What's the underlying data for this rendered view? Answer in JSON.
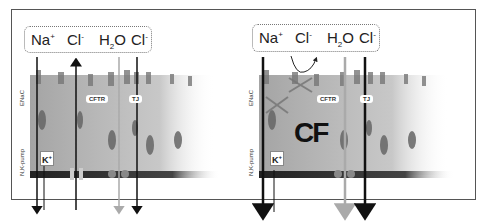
{
  "panels": [
    {
      "id": "normal",
      "lumen_ions": [
        {
          "base": "Na",
          "sup": "+",
          "sub": ""
        },
        {
          "base": "Cl",
          "sup": "-",
          "sub": ""
        },
        {
          "base": "H",
          "sub": "2",
          "sup": "",
          "tail": "O"
        },
        {
          "base": "Cl",
          "sup": "-",
          "sub": ""
        }
      ],
      "labels": {
        "enac": "ENaC",
        "cftr": "CFTR",
        "tj": "TJ",
        "pump": "N,K-pump",
        "k": "K",
        "k_sup": "+"
      }
    },
    {
      "id": "cystic-fibrosis",
      "lumen_ions": [
        {
          "base": "Na",
          "sup": "+",
          "sub": ""
        },
        {
          "base": "Cl",
          "sup": "-",
          "sub": ""
        },
        {
          "base": "H",
          "sub": "2",
          "sup": "",
          "tail": "O"
        },
        {
          "base": "Cl",
          "sup": "-",
          "sub": ""
        }
      ],
      "labels": {
        "enac": "ENaC",
        "cftr": "CFTR",
        "tj": "TJ",
        "pump": "N,K-pump",
        "k": "K",
        "k_sup": "+",
        "cf": "CF"
      }
    }
  ],
  "colors": {
    "arrow_dark": "#111111",
    "arrow_gray": "#aaaaaa",
    "cell_tint": "#bbbbbb",
    "membrane": "#333333",
    "pump_bead": "#888888"
  }
}
